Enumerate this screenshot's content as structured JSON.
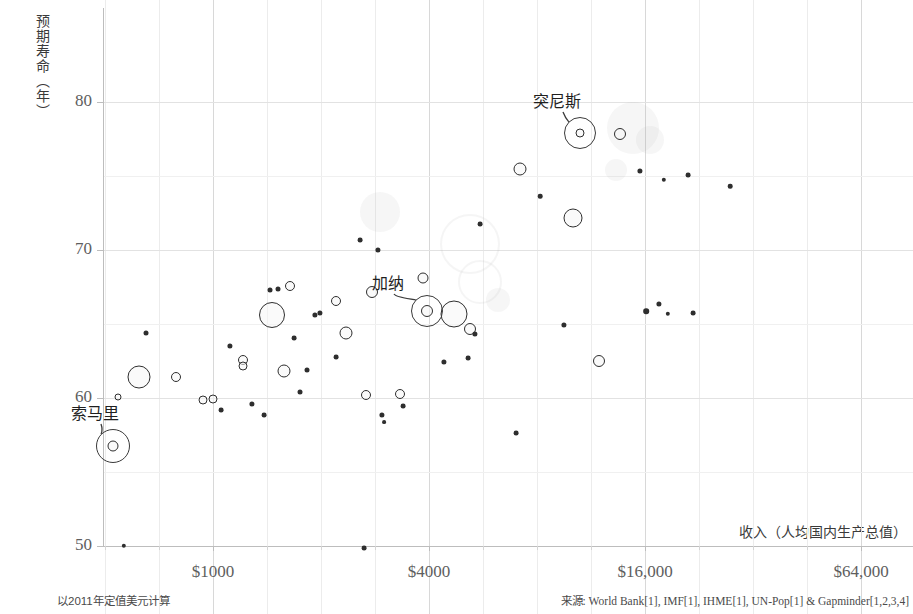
{
  "chart_data": {
    "type": "scatter",
    "title": "",
    "xlabel": "收入（人均国内生产总值）",
    "ylabel": "预期寿命（年）",
    "x_scale": "log",
    "xlim": [
      400,
      90000
    ],
    "ylim": [
      48.5,
      83.5
    ],
    "x_ticks": [
      {
        "value": 1000,
        "label": "$1000"
      },
      {
        "value": 4000,
        "label": "$4000"
      },
      {
        "value": 16000,
        "label": "$16,000"
      },
      {
        "value": 64000,
        "label": "$64,000"
      }
    ],
    "y_ticks": [
      {
        "value": 50,
        "label": "50"
      },
      {
        "value": 60,
        "label": "60"
      },
      {
        "value": 70,
        "label": "70"
      },
      {
        "value": 80,
        "label": "80"
      }
    ],
    "grid": true,
    "legend": "none",
    "note_left": "以2011年定值美元计算",
    "source": "来源: World Bank[1], IMF[1], IHME[1], UN-Pop[1] & Gapminder[1,2,3,4]",
    "annotations": [
      {
        "label": "索马里",
        "label_x": 95,
        "label_y": 412,
        "point_x": 113,
        "point_y": 446,
        "halo_r": 17
      },
      {
        "label": "加纳",
        "label_x": 388,
        "label_y": 282,
        "point_x": 427,
        "point_y": 311,
        "halo_r": 16
      },
      {
        "label": "突尼斯",
        "label_x": 557,
        "label_y": 100,
        "point_x": 580,
        "point_y": 133,
        "halo_r": 16
      }
    ],
    "points": [
      {
        "x": 113,
        "y": 446,
        "r": 5.5
      },
      {
        "x": 427,
        "y": 311,
        "r": 6.0
      },
      {
        "x": 580,
        "y": 133,
        "r": 4.5
      },
      {
        "x": 124,
        "y": 546,
        "r": 2.2
      },
      {
        "x": 364,
        "y": 548,
        "r": 2.4
      },
      {
        "x": 139,
        "y": 377,
        "r": 11.5
      },
      {
        "x": 118,
        "y": 397,
        "r": 3.5
      },
      {
        "x": 146,
        "y": 333,
        "r": 2.5
      },
      {
        "x": 176,
        "y": 377,
        "r": 5.0
      },
      {
        "x": 203,
        "y": 400,
        "r": 4.5
      },
      {
        "x": 213,
        "y": 399,
        "r": 4.5
      },
      {
        "x": 221,
        "y": 410,
        "r": 2.4
      },
      {
        "x": 230,
        "y": 346,
        "r": 2.6
      },
      {
        "x": 243,
        "y": 360,
        "r": 5.0
      },
      {
        "x": 243,
        "y": 366,
        "r": 4.5
      },
      {
        "x": 252,
        "y": 404,
        "r": 2.6
      },
      {
        "x": 264,
        "y": 415,
        "r": 2.4
      },
      {
        "x": 270,
        "y": 290,
        "r": 2.5
      },
      {
        "x": 272,
        "y": 315,
        "r": 13.0
      },
      {
        "x": 284,
        "y": 371,
        "r": 6.5
      },
      {
        "x": 278,
        "y": 289,
        "r": 2.5
      },
      {
        "x": 290,
        "y": 286,
        "r": 5.0
      },
      {
        "x": 300,
        "y": 392,
        "r": 2.5
      },
      {
        "x": 307,
        "y": 370,
        "r": 2.5
      },
      {
        "x": 294,
        "y": 338,
        "r": 2.4
      },
      {
        "x": 315,
        "y": 315,
        "r": 2.6
      },
      {
        "x": 320,
        "y": 313,
        "r": 2.6
      },
      {
        "x": 336,
        "y": 301,
        "r": 5.0
      },
      {
        "x": 346,
        "y": 333,
        "r": 6.5
      },
      {
        "x": 336,
        "y": 357,
        "r": 2.4
      },
      {
        "x": 366,
        "y": 395,
        "r": 5.0
      },
      {
        "x": 360,
        "y": 240,
        "r": 2.4
      },
      {
        "x": 372,
        "y": 292,
        "r": 6.0
      },
      {
        "x": 378,
        "y": 250,
        "r": 2.6
      },
      {
        "x": 382,
        "y": 415,
        "r": 2.6
      },
      {
        "x": 384,
        "y": 422,
        "r": 1.9
      },
      {
        "x": 400,
        "y": 394,
        "r": 5.0
      },
      {
        "x": 403,
        "y": 406,
        "r": 2.4
      },
      {
        "x": 423,
        "y": 278,
        "r": 5.5
      },
      {
        "x": 444,
        "y": 362,
        "r": 2.6
      },
      {
        "x": 454,
        "y": 314,
        "r": 13.5
      },
      {
        "x": 470,
        "y": 329,
        "r": 6.0
      },
      {
        "x": 475,
        "y": 334,
        "r": 2.6
      },
      {
        "x": 468,
        "y": 358,
        "r": 2.4
      },
      {
        "x": 480,
        "y": 224,
        "r": 2.4
      },
      {
        "x": 516,
        "y": 433,
        "r": 2.4
      },
      {
        "x": 520,
        "y": 169,
        "r": 6.5
      },
      {
        "x": 540,
        "y": 196,
        "r": 2.3
      },
      {
        "x": 564,
        "y": 325,
        "r": 2.6
      },
      {
        "x": 573,
        "y": 218,
        "r": 9.5
      },
      {
        "x": 620,
        "y": 134,
        "r": 6.0
      },
      {
        "x": 599,
        "y": 361,
        "r": 6.0
      },
      {
        "x": 640,
        "y": 171,
        "r": 2.6
      },
      {
        "x": 646,
        "y": 311,
        "r": 2.8
      },
      {
        "x": 659,
        "y": 304,
        "r": 2.6
      },
      {
        "x": 664,
        "y": 180,
        "r": 2.2
      },
      {
        "x": 668,
        "y": 314,
        "r": 2.2
      },
      {
        "x": 688,
        "y": 175,
        "r": 2.4
      },
      {
        "x": 693,
        "y": 313,
        "r": 2.4
      },
      {
        "x": 730,
        "y": 186,
        "r": 2.3
      }
    ],
    "watermarks": [
      {
        "x": 633,
        "y": 128,
        "r": 26,
        "type": "fill"
      },
      {
        "x": 650,
        "y": 140,
        "r": 14,
        "type": "fill"
      },
      {
        "x": 616,
        "y": 170,
        "r": 11,
        "type": "fill"
      },
      {
        "x": 470,
        "y": 244,
        "r": 30,
        "type": "ring"
      },
      {
        "x": 480,
        "y": 282,
        "r": 22,
        "type": "ring"
      },
      {
        "x": 498,
        "y": 300,
        "r": 12,
        "type": "fill"
      },
      {
        "x": 380,
        "y": 212,
        "r": 20,
        "type": "fill"
      }
    ]
  }
}
